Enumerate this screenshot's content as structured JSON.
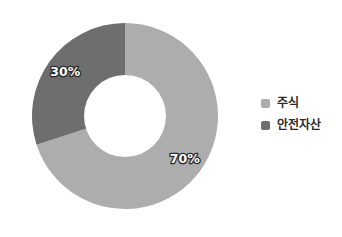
{
  "chart_data": {
    "type": "pie",
    "variant": "donut",
    "title": "",
    "subtitle": "",
    "xlabel": "",
    "ylabel": "",
    "categories": [
      "주식",
      "안전자산"
    ],
    "values": [
      70,
      30
    ],
    "unit": "%",
    "data_labels": [
      "70%",
      "30%"
    ],
    "slices": [
      {
        "name": "주식",
        "value": 70,
        "label": "70%",
        "color": "#ADADAD",
        "start_angle_deg": 0,
        "end_angle_deg": 252
      },
      {
        "name": "안전자산",
        "value": 30,
        "label": "30%",
        "color": "#6E6E6E",
        "start_angle_deg": 252,
        "end_angle_deg": 360
      }
    ],
    "legend": {
      "position": "right",
      "entries": [
        {
          "label": "주식",
          "color": "#ADADAD"
        },
        {
          "label": "안전자산",
          "color": "#6E6E6E"
        }
      ]
    },
    "geometry": {
      "center_x": 125,
      "center_y": 116,
      "outer_radius": 93,
      "inner_radius": 41,
      "start_at_top": true,
      "direction": "clockwise"
    },
    "grid": false,
    "background_color": "#FFFFFF",
    "label_text_color": "#FFFFFF",
    "label_outline_color": "#2A2A2A"
  }
}
